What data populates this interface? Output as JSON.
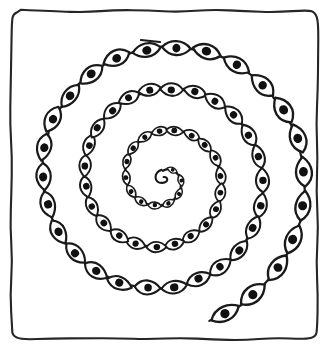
{
  "artwork": {
    "title": "Spiral of Eyes",
    "medium": "black ink line drawing on white paper",
    "subject": "a hand-drawn spiral strung with lens-shaped eye motifs, enclosed in a hand-drawn rectangular frame",
    "background_color": "#ffffff",
    "ink_color": "#1a1a1a",
    "canvas": {
      "width": 328,
      "height": 351
    }
  },
  "frame": {
    "name": "hand-drawn border rectangle",
    "stroke_color": "#262626",
    "stroke_width": 2.1,
    "corner_radius": 10,
    "left": 11,
    "top": 11,
    "right": 317,
    "bottom": 339,
    "wobble": 1.6
  },
  "spiral": {
    "type": "archimedean",
    "center_x": 163,
    "center_y": 178,
    "turns": 3.45,
    "start_angle_deg": -90,
    "inner_radius": 7,
    "outer_radius": 150,
    "direction": "clockwise-outward",
    "stroke_width": 2.2,
    "tail_stub": {
      "name": "free line end at top",
      "x1": 141,
      "y1": 40,
      "x2": 160,
      "y2": 42
    },
    "center_curl": {
      "name": "tiny hook at spiral core",
      "radius": 6.5
    }
  },
  "eyes": {
    "count": 46,
    "description": "pointed oval (vesica / lens) outlines threaded on the spiral line, each with a solid round pupil at its center",
    "pupil_color": "#111111",
    "body_fill": "#ffffff",
    "body_stroke": "#1a1a1a",
    "min_half_length": 4.5,
    "max_half_length": 15.5,
    "min_half_width": 2.6,
    "max_half_width": 9.0,
    "min_pupil_radius": 1.6,
    "max_pupil_radius": 4.6,
    "orientation": "long axis perpendicular to the spiral tangent",
    "stroke_width_min": 1.3,
    "stroke_width_max": 2.4,
    "arc_spacing_min": 13,
    "arc_spacing_max": 36
  },
  "palette": {
    "paper": "#ffffff",
    "ink": "#1a1a1a",
    "frame": "#262626",
    "pupil": "#111111"
  }
}
